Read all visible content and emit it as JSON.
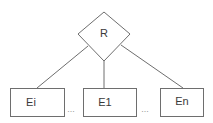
{
  "diagram": {
    "type": "er-relationship",
    "relationship": {
      "label": "R",
      "shape": "diamond"
    },
    "entities": [
      {
        "label": "Ei"
      },
      {
        "label": "E1"
      },
      {
        "label": "En"
      }
    ],
    "ellipses": [
      "...",
      "..."
    ],
    "colors": {
      "stroke": "#6e6e6e",
      "text": "#3a3a3a",
      "background": "#ffffff"
    }
  }
}
